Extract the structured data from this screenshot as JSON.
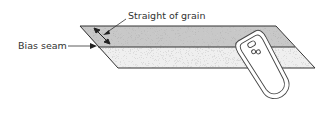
{
  "diagram": {
    "labels": {
      "grain": "Straight of grain",
      "seam": "Bias seam"
    },
    "colors": {
      "top_fabric": "#c9c9c9",
      "bottom_fabric": "#ececec",
      "outline": "#333333",
      "iron_fill": "#ffffff"
    }
  }
}
